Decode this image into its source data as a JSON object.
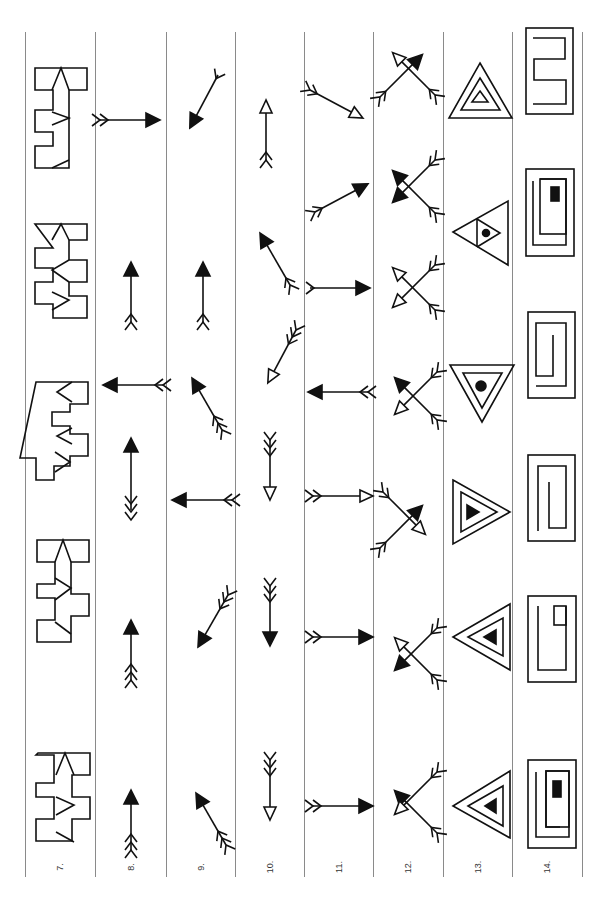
{
  "page": {
    "orientation": "rotated-90-ccw",
    "columns": [
      {
        "label": "7.",
        "type": "block-figures",
        "items": [
          "block-1",
          "block-2",
          "block-3",
          "block-4",
          "block-5",
          "block-6"
        ]
      },
      {
        "label": "8.",
        "type": "arrows",
        "items": [
          "right-filled-double-fletch",
          "up-filled-double-fletch",
          "left-filled-double-fletch",
          "up-filled-reverse-triple-fletch",
          "up-filled-triple-fletch",
          "up-filled-triple-fletch"
        ]
      },
      {
        "label": "9.",
        "type": "arrows",
        "items": [
          "down-left-filled-single-fletch",
          "up-filled-double-fletch",
          "up-left-filled-triple-fletch",
          "left-filled-double-fletch",
          "down-left-filled-triple-fletch",
          "up-left-filled-triple-fletch"
        ]
      },
      {
        "label": "10.",
        "type": "arrows",
        "items": [
          "up-open-double-fletch",
          "up-left-filled-double-fletch",
          "down-left-open-triple-fletch",
          "down-open-triple-fletch",
          "down-filled-triple-fletch",
          "down-open-triple-fletch"
        ]
      },
      {
        "label": "11.",
        "type": "arrows",
        "items": [
          "down-right-open-double-fletch",
          "up-right-filled-double-fletch",
          "right-filled-single-fletch",
          "left-filled-double-fletch",
          "right-open-double-fletch",
          "right-filled-double-fletch",
          "right-filled-double-fletch"
        ]
      },
      {
        "label": "12.",
        "type": "crossed-arrows",
        "items": [
          "open-ul-filled-ur",
          "filled-ul-filled-dl",
          "open-ul-open-dl",
          "filled-ul-open-dl",
          "fletch-ul-open-dr-filled-ur",
          "open-ul-filled-dl",
          "filled-ul-open-dl"
        ]
      },
      {
        "label": "13.",
        "type": "nested-triangles",
        "items": [
          "up-triangle-open",
          "left-triangle-dot",
          "down-triangle-dot",
          "right-triangle-filled",
          "left-triangle-filled",
          "left-triangle-filled"
        ]
      },
      {
        "label": "14.",
        "type": "spiral-rectangles",
        "items": [
          "spiral-1",
          "spiral-filled-2",
          "spiral-3",
          "spiral-4",
          "spiral-open-5",
          "spiral-filled-6"
        ]
      }
    ]
  },
  "colors": {
    "ink": "#111111",
    "rule": "#8a8a8a",
    "paper": "#ffffff"
  }
}
